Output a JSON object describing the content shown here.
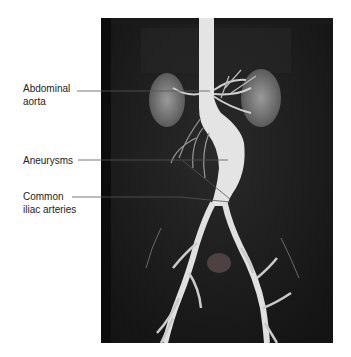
{
  "figure": {
    "type": "angiogram",
    "labels": [
      {
        "id": "abdominal-aorta",
        "line1": "Abdominal",
        "line2": "aorta"
      },
      {
        "id": "aneurysms",
        "line1": "Aneurysms"
      },
      {
        "id": "common-iliac-arteries",
        "line1": "Common",
        "line2": "iliac arteries"
      }
    ],
    "colors": {
      "background": "#ffffff",
      "image_bg": "#111111",
      "vessel": "#e6e6e6",
      "kidney": "#8a8a8a",
      "leader_line": "#555555",
      "label_text": "#222222"
    }
  }
}
